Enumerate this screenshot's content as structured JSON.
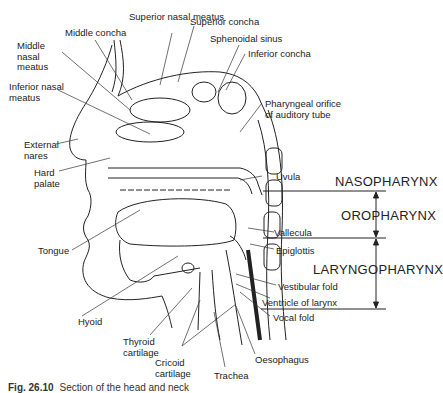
{
  "figure": {
    "caption_number": "Fig. 26.10",
    "caption_text": "Section of the head and neck"
  },
  "labels": {
    "superior_nasal_meatus": "Superior nasal meatus",
    "superior_concha": "Superior concha",
    "middle_concha": "Middle concha",
    "sphenoidal_sinus": "Sphenoidal sinus",
    "middle_nasal_meatus": "Middle nasal meatus",
    "inferior_concha": "Inferior concha",
    "inferior_nasal_meatus": "Inferior nasal meatus",
    "pharyngeal_orifice": "Pharyngeal orifice of auditory tube",
    "external_nares": "External nares",
    "hard_palate": "Hard palate",
    "uvula": "Uvula",
    "tongue": "Tongue",
    "vallecula": "Vallecula",
    "epiglottis": "Epiglottis",
    "vestibular_fold": "Vestibular fold",
    "ventricle_of_larynx": "Ventricle of larynx",
    "vocal_fold": "Vocal fold",
    "hyoid": "Hyoid",
    "thyroid_cartilage": "Thyroid cartilage",
    "cricoid_cartilage": "Cricoid cartilage",
    "trachea": "Trachea",
    "oesophagus": "Oesophagus"
  },
  "regions": {
    "nasopharynx": "NASOPHARYNX",
    "oropharynx": "OROPHARYNX",
    "laryngopharynx": "LARYNGOPHARYNX"
  },
  "colors": {
    "ink": "#222222",
    "background": "#ffffff"
  }
}
